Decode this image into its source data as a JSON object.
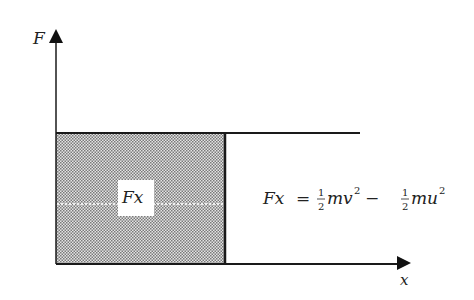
{
  "diagram": {
    "y_axis_label": "F",
    "x_axis_label": "x",
    "area_label": "Fx",
    "equation": {
      "lhs": "Fx",
      "equals": "=",
      "term1_coef_num": "1",
      "term1_coef_den": "2",
      "term1_var": "mv",
      "term1_exp": "2",
      "minus": "−",
      "term2_coef_num": "1",
      "term2_coef_den": "2",
      "term2_var": "mu",
      "term2_exp": "2"
    },
    "colors": {
      "line": "#1a1a1a",
      "shade": "#bdbdbd"
    }
  }
}
